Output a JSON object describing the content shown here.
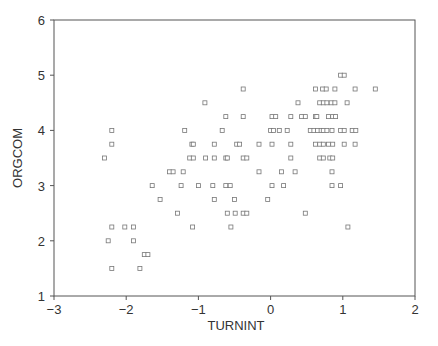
{
  "chart_data": {
    "type": "scatter",
    "title": "",
    "xlabel": "TURNINT",
    "ylabel": "ORGCOM",
    "xlim": [
      -3,
      2
    ],
    "ylim": [
      1,
      6
    ],
    "xticks": [
      -3,
      -2,
      -1,
      0,
      1,
      2
    ],
    "yticks": [
      1,
      2,
      3,
      4,
      5,
      6
    ],
    "xtick_labels": [
      "−3",
      "−2",
      "−1",
      "0",
      "1",
      "2"
    ],
    "ytick_labels": [
      "1",
      "2",
      "3",
      "4",
      "5",
      "6"
    ],
    "grid": false,
    "legend": null,
    "marker": "hollow-square",
    "series": [
      {
        "name": "ORGCOM vs TURNINT",
        "points": [
          [
            -2.2,
            4.0
          ],
          [
            -2.2,
            3.75
          ],
          [
            -2.3,
            3.5
          ],
          [
            -2.2,
            2.25
          ],
          [
            -2.02,
            2.25
          ],
          [
            -1.9,
            2.25
          ],
          [
            -2.25,
            2.0
          ],
          [
            -1.9,
            2.0
          ],
          [
            -1.75,
            1.75
          ],
          [
            -1.7,
            1.75
          ],
          [
            -2.2,
            1.5
          ],
          [
            -1.81,
            1.5
          ],
          [
            -1.64,
            3.0
          ],
          [
            -1.53,
            2.75
          ],
          [
            -1.4,
            3.25
          ],
          [
            -1.35,
            3.25
          ],
          [
            -1.21,
            3.25
          ],
          [
            -1.24,
            3.0
          ],
          [
            -1.29,
            2.5
          ],
          [
            -1.19,
            4.0
          ],
          [
            -0.91,
            4.5
          ],
          [
            -1.09,
            3.75
          ],
          [
            -1.07,
            3.75
          ],
          [
            -1.12,
            3.5
          ],
          [
            -1.07,
            3.5
          ],
          [
            -1.08,
            2.25
          ],
          [
            -1.0,
            3.0
          ],
          [
            -0.9,
            3.5
          ],
          [
            -0.78,
            3.75
          ],
          [
            -0.78,
            3.5
          ],
          [
            -0.8,
            3.0
          ],
          [
            -0.78,
            2.75
          ],
          [
            -0.67,
            4.0
          ],
          [
            -0.62,
            4.25
          ],
          [
            -0.62,
            3.5
          ],
          [
            -0.6,
            3.5
          ],
          [
            -0.62,
            3.0
          ],
          [
            -0.56,
            3.0
          ],
          [
            -0.6,
            2.5
          ],
          [
            -0.49,
            2.5
          ],
          [
            -0.55,
            2.25
          ],
          [
            -0.5,
            2.75
          ],
          [
            -0.47,
            3.75
          ],
          [
            -0.43,
            3.75
          ],
          [
            -0.38,
            4.75
          ],
          [
            -0.38,
            4.25
          ],
          [
            -0.38,
            3.5
          ],
          [
            -0.33,
            3.5
          ],
          [
            -0.38,
            2.5
          ],
          [
            -0.33,
            2.5
          ],
          [
            -0.16,
            3.75
          ],
          [
            -0.16,
            3.25
          ],
          [
            -0.04,
            2.75
          ],
          [
            0.0,
            4.0
          ],
          [
            0.04,
            4.0
          ],
          [
            0.02,
            4.25
          ],
          [
            0.07,
            4.25
          ],
          [
            0.02,
            3.75
          ],
          [
            0.02,
            3.0
          ],
          [
            0.12,
            4.0
          ],
          [
            0.23,
            4.0
          ],
          [
            0.15,
            3.25
          ],
          [
            0.18,
            3.0
          ],
          [
            0.28,
            4.25
          ],
          [
            0.28,
            3.75
          ],
          [
            0.28,
            3.5
          ],
          [
            0.34,
            3.25
          ],
          [
            0.38,
            4.5
          ],
          [
            0.43,
            4.25
          ],
          [
            0.48,
            4.25
          ],
          [
            0.48,
            2.5
          ],
          [
            0.55,
            4.0
          ],
          [
            0.6,
            4.0
          ],
          [
            0.65,
            4.0
          ],
          [
            0.7,
            4.0
          ],
          [
            0.73,
            4.0
          ],
          [
            0.78,
            4.0
          ],
          [
            0.85,
            4.0
          ],
          [
            0.62,
            4.25
          ],
          [
            0.64,
            4.25
          ],
          [
            0.62,
            4.75
          ],
          [
            0.72,
            4.75
          ],
          [
            0.77,
            4.75
          ],
          [
            0.89,
            4.75
          ],
          [
            0.68,
            4.5
          ],
          [
            0.73,
            4.5
          ],
          [
            0.78,
            4.5
          ],
          [
            0.84,
            4.5
          ],
          [
            0.89,
            4.5
          ],
          [
            0.8,
            4.25
          ],
          [
            0.86,
            4.25
          ],
          [
            0.9,
            4.25
          ],
          [
            0.62,
            3.75
          ],
          [
            0.68,
            3.75
          ],
          [
            0.73,
            3.75
          ],
          [
            0.8,
            3.75
          ],
          [
            0.86,
            3.75
          ],
          [
            0.68,
            3.5
          ],
          [
            0.73,
            3.5
          ],
          [
            0.82,
            3.5
          ],
          [
            0.86,
            3.5
          ],
          [
            0.85,
            3.25
          ],
          [
            0.85,
            3.0
          ],
          [
            0.97,
            3.0
          ],
          [
            0.97,
            5.0
          ],
          [
            1.02,
            5.0
          ],
          [
            0.97,
            4.0
          ],
          [
            1.02,
            4.0
          ],
          [
            1.13,
            4.0
          ],
          [
            1.18,
            4.0
          ],
          [
            1.02,
            3.75
          ],
          [
            1.17,
            3.75
          ],
          [
            1.06,
            4.5
          ],
          [
            1.17,
            4.75
          ],
          [
            1.45,
            4.75
          ],
          [
            1.07,
            2.25
          ]
        ]
      }
    ]
  },
  "colors": {
    "axis": "#555555",
    "marker_stroke": "#777777",
    "text": "#333333",
    "background": "#ffffff"
  }
}
